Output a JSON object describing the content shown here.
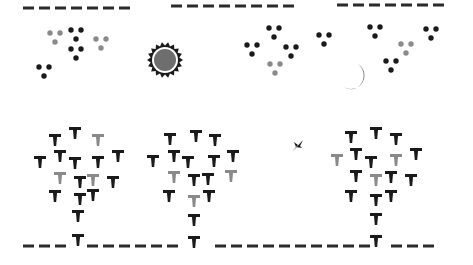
{
  "canvas": {
    "width": 473,
    "height": 265,
    "background": "#ffffff"
  },
  "colors": {
    "black": "#1a1a1a",
    "gray": "#8a8a8a",
    "sun_core": "#6e6e6e",
    "moon": "#7a7a7a",
    "dash": "#2a2a2a"
  },
  "top_dashes": [
    {
      "x1": 23,
      "x2": 134,
      "y": 8
    },
    {
      "x1": 171,
      "x2": 299,
      "y": 6
    },
    {
      "x1": 337,
      "x2": 448,
      "y": 5
    }
  ],
  "ground_dashes": {
    "x1": 23,
    "x2": 448,
    "y": 246
  },
  "sun": {
    "cx": 165,
    "cy": 60,
    "r": 11
  },
  "moon": {
    "cx": 356,
    "cy": 77,
    "r": 13
  },
  "bird": {
    "x": 297,
    "y": 146
  },
  "dot_clusters": [
    {
      "x": 50,
      "y": 33,
      "color": "gray"
    },
    {
      "x": 71,
      "y": 30,
      "color": "black"
    },
    {
      "x": 71,
      "y": 49,
      "color": "black"
    },
    {
      "x": 96,
      "y": 39,
      "color": "gray"
    },
    {
      "x": 39,
      "y": 67,
      "color": "black"
    },
    {
      "x": 269,
      "y": 28,
      "color": "black"
    },
    {
      "x": 247,
      "y": 45,
      "color": "black"
    },
    {
      "x": 286,
      "y": 47,
      "color": "black"
    },
    {
      "x": 270,
      "y": 64,
      "color": "gray"
    },
    {
      "x": 319,
      "y": 35,
      "color": "black"
    },
    {
      "x": 370,
      "y": 27,
      "color": "black"
    },
    {
      "x": 426,
      "y": 29,
      "color": "black"
    },
    {
      "x": 401,
      "y": 44,
      "color": "gray"
    },
    {
      "x": 386,
      "y": 61,
      "color": "black"
    }
  ],
  "trees": [
    {
      "name": "tree-left",
      "marks": [
        [
          55,
          134,
          "black"
        ],
        [
          75,
          127,
          "black"
        ],
        [
          98,
          134,
          "gray"
        ],
        [
          40,
          156,
          "black"
        ],
        [
          60,
          150,
          "black"
        ],
        [
          75,
          157,
          "black"
        ],
        [
          98,
          156,
          "black"
        ],
        [
          118,
          150,
          "black"
        ],
        [
          60,
          172,
          "gray"
        ],
        [
          80,
          176,
          "black"
        ],
        [
          93,
          174,
          "gray"
        ],
        [
          113,
          176,
          "black"
        ],
        [
          55,
          190,
          "black"
        ],
        [
          80,
          193,
          "black"
        ],
        [
          93,
          189,
          "black"
        ],
        [
          78,
          210,
          "black"
        ],
        [
          78,
          234,
          "black"
        ]
      ]
    },
    {
      "name": "tree-middle",
      "marks": [
        [
          170,
          133,
          "black"
        ],
        [
          196,
          130,
          "black"
        ],
        [
          215,
          134,
          "black"
        ],
        [
          153,
          155,
          "black"
        ],
        [
          174,
          150,
          "black"
        ],
        [
          188,
          156,
          "black"
        ],
        [
          214,
          155,
          "black"
        ],
        [
          233,
          150,
          "black"
        ],
        [
          174,
          171,
          "gray"
        ],
        [
          194,
          174,
          "black"
        ],
        [
          208,
          173,
          "black"
        ],
        [
          231,
          170,
          "gray"
        ],
        [
          169,
          190,
          "black"
        ],
        [
          194,
          195,
          "gray"
        ],
        [
          209,
          190,
          "black"
        ],
        [
          194,
          214,
          "black"
        ],
        [
          194,
          236,
          "black"
        ]
      ]
    },
    {
      "name": "tree-right",
      "marks": [
        [
          351,
          131,
          "black"
        ],
        [
          376,
          127,
          "black"
        ],
        [
          396,
          133,
          "black"
        ],
        [
          337,
          154,
          "gray"
        ],
        [
          356,
          148,
          "black"
        ],
        [
          371,
          156,
          "black"
        ],
        [
          396,
          154,
          "gray"
        ],
        [
          416,
          148,
          "black"
        ],
        [
          356,
          170,
          "black"
        ],
        [
          376,
          174,
          "gray"
        ],
        [
          391,
          171,
          "black"
        ],
        [
          411,
          174,
          "black"
        ],
        [
          351,
          190,
          "black"
        ],
        [
          376,
          194,
          "black"
        ],
        [
          391,
          190,
          "black"
        ],
        [
          376,
          213,
          "black"
        ],
        [
          376,
          235,
          "black"
        ]
      ]
    }
  ]
}
